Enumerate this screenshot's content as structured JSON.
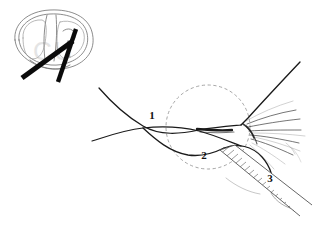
{
  "figure": {
    "background_color": "#ffffff",
    "width": 329,
    "height": 231,
    "line_color": "#1a1a1a",
    "accent_color": "#0b0b0b",
    "guide_color": "#8f8f8f"
  },
  "inset": {
    "name": "orbit-overview-inset",
    "description": "Small anterior view of the orbital rim and globe with two instruments crossing at the lateral canthus",
    "instrument_count": 2
  },
  "main": {
    "description": "Magnified lateral canthal region showing the eyelid margins, eyelashes and a hatched surgical instrument",
    "magnifier": {
      "name": "magnified-region-circle",
      "center_x": 208,
      "center_y": 127,
      "radius": 42,
      "style": "dashed"
    }
  },
  "callouts": [
    {
      "id": "1",
      "label": "1",
      "x": 152,
      "y": 119,
      "refers_to": "upper-eyelid-margin"
    },
    {
      "id": "2",
      "label": "2",
      "x": 204,
      "y": 159,
      "refers_to": "lower-eyelid-margin-lateral-canthal-tendon"
    },
    {
      "id": "3",
      "label": "3",
      "x": 270,
      "y": 182,
      "refers_to": "surgical-instrument-scissors-blade"
    }
  ],
  "watermark": {
    "text": "CU",
    "visible": true
  }
}
